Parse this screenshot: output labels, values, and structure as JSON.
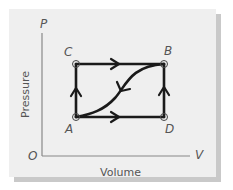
{
  "diagram": {
    "axes": {
      "y_axis_symbol": "P",
      "x_axis_symbol": "V",
      "origin_label": "O",
      "y_label": "Pressure",
      "x_label": "Volume"
    },
    "points": [
      {
        "name": "A",
        "position": "bottom-left"
      },
      {
        "name": "B",
        "position": "top-right"
      },
      {
        "name": "C",
        "position": "top-left"
      },
      {
        "name": "D",
        "position": "bottom-right"
      }
    ],
    "paths": [
      {
        "from": "A",
        "to": "C",
        "shape": "straight",
        "direction": "up"
      },
      {
        "from": "C",
        "to": "B",
        "shape": "straight",
        "direction": "right"
      },
      {
        "from": "A",
        "to": "D",
        "shape": "straight",
        "direction": "right"
      },
      {
        "from": "D",
        "to": "B",
        "shape": "straight",
        "direction": "up"
      },
      {
        "from": "B",
        "to": "A",
        "shape": "curve",
        "direction": "down-left"
      }
    ],
    "colors": {
      "panel": "#efefef",
      "shadow": "#c9c9c9",
      "path": "#1a1a1a",
      "axis": "#777777",
      "text": "#555555"
    }
  }
}
